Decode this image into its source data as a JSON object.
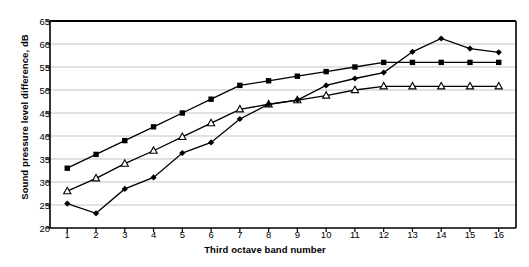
{
  "chart_data": {
    "type": "line",
    "title": "",
    "xlabel": "Third octave band number",
    "ylabel": "Sound pressure level difference, dB",
    "x": [
      1,
      2,
      3,
      4,
      5,
      6,
      7,
      8,
      9,
      10,
      11,
      12,
      13,
      14,
      15,
      16
    ],
    "xtick_labels": [
      "1",
      "2",
      "3",
      "4",
      "5",
      "6",
      "7",
      "8",
      "9",
      "10",
      "11",
      "12",
      "13",
      "14",
      "15",
      "16"
    ],
    "ytick_labels": [
      "20",
      "25",
      "30",
      "35",
      "40",
      "45",
      "50",
      "55",
      "60",
      "65"
    ],
    "yticks": [
      20,
      25,
      30,
      35,
      40,
      45,
      50,
      55,
      60,
      65
    ],
    "ylim": [
      20,
      65
    ],
    "xlim": [
      0.4,
      16.6
    ],
    "grid": "horizontal",
    "legend": "none",
    "series": [
      {
        "name": "series-squares",
        "marker": "filled-square",
        "color": "#000000",
        "values": [
          33,
          36,
          39,
          42,
          45,
          48,
          51,
          52,
          53,
          54,
          55,
          56,
          56,
          56,
          56,
          56
        ]
      },
      {
        "name": "series-triangles",
        "marker": "open-triangle",
        "color": "#000000",
        "values": [
          28,
          30.8,
          34,
          36.8,
          39.8,
          42.8,
          45.8,
          46.9,
          47.8,
          48.8,
          50,
          50.8,
          50.8,
          50.8,
          50.8,
          50.8
        ]
      },
      {
        "name": "series-diamonds",
        "marker": "filled-diamond",
        "color": "#000000",
        "values": [
          25.3,
          23.2,
          28.5,
          31,
          36.3,
          38.6,
          43.7,
          46.9,
          47.8,
          51,
          52.5,
          53.8,
          58.3,
          61.2,
          59,
          58.2
        ]
      }
    ]
  },
  "axes": {
    "ylabel": "Sound pressure level difference, dB",
    "xlabel": "Third octave band number"
  }
}
